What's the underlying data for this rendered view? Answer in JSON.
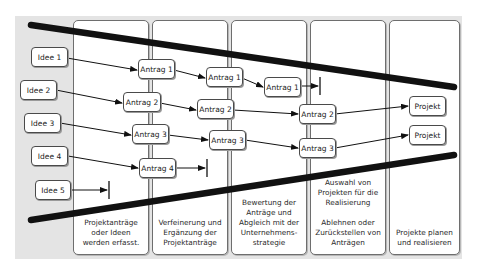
{
  "diagram": {
    "type": "funnel-process",
    "columns": [
      {
        "id": "col1",
        "label": "Projektanträge\noder Ideen\nwerden erfasst."
      },
      {
        "id": "col2",
        "label": "Verfeinerung und\nErgänzung der\nProjektanträge"
      },
      {
        "id": "col3",
        "label": "Bewertung der\nAnträge und\nAbgleich mit der\nUnternehmens-\nstrategie"
      },
      {
        "id": "col4",
        "label": "Auswahl von\nProjekten für die\nRealisierung\n\nAblehnen oder\nZurückstellen von\nAnträgen"
      },
      {
        "id": "col5",
        "label": "Projekte planen\nund realisieren"
      }
    ],
    "ideas": [
      "Idee 1",
      "Idee 2",
      "Idee 3",
      "Idee 4",
      "Idee 5"
    ],
    "stage2": [
      "Antrag 1",
      "Antrag 2",
      "Antrag 3",
      "Antrag 4"
    ],
    "stage3": [
      "Antrag 1",
      "Antrag 2",
      "Antrag 3"
    ],
    "stage4": [
      "Antrag 1",
      "Antrag 2",
      "Antrag 3"
    ],
    "projects": [
      "Projekt",
      "Projekt"
    ],
    "colors": {
      "background": "#e4e4e4",
      "panel": "#ffffff",
      "funnel_line": "#111111",
      "arrow": "#111111"
    }
  }
}
